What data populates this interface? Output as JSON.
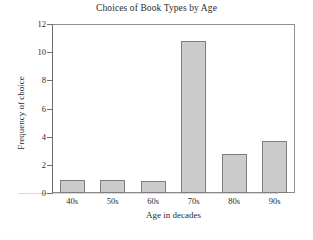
{
  "chart_data": {
    "type": "bar",
    "title": "Choices of Book Types by Age",
    "xlabel": "Age in decades",
    "ylabel": "Frequency of choice",
    "categories": [
      "40s",
      "50s",
      "60s",
      "70s",
      "80s",
      "90s"
    ],
    "values": [
      0.95,
      0.92,
      0.88,
      10.8,
      2.75,
      3.7
    ],
    "ylim": [
      0,
      12
    ],
    "yticks": [
      0,
      2,
      4,
      6,
      8,
      10,
      12
    ],
    "ytick_labels": [
      "0",
      "2",
      "4",
      "6",
      "8",
      "10",
      "12"
    ],
    "grid": false,
    "legend": false,
    "bar_fill": "#cccccc",
    "bar_edge": "#7d7d7d",
    "axis_color": "#6e6e6e",
    "background": "#ffffff"
  }
}
